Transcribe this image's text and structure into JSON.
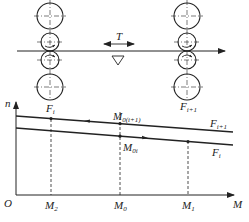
{
  "diagram": {
    "type": "rolling-mill-tension-diagram",
    "colors": {
      "ink": "#222222",
      "background": "#ffffff"
    },
    "stands": [
      {
        "id": "left",
        "label_base": "F",
        "label_sub": "i"
      },
      {
        "id": "right",
        "label_base": "F",
        "label_sub": "i+1"
      }
    ],
    "tension_label": "T",
    "level_marker": "triangle",
    "graph": {
      "y_axis_label": "n",
      "x_axis_label": "M",
      "origin_label": "O",
      "x_ticks": [
        {
          "base": "M",
          "sub": "2"
        },
        {
          "base": "M",
          "sub": "0"
        },
        {
          "base": "M",
          "sub": "1"
        }
      ],
      "point_labels": {
        "upper_left": {
          "base": "F",
          "sub": "i"
        },
        "top_mid": {
          "base": "M",
          "sub": "0(i+1)"
        },
        "lower_mid": {
          "base": "M",
          "sub": "0i"
        },
        "right_stand": {
          "base": "F",
          "sub": "i+1"
        }
      },
      "lines": [
        {
          "name": "upper",
          "label_base": "F",
          "label_sub": "i+1"
        },
        {
          "name": "lower",
          "label_base": "F",
          "label_sub": "i"
        }
      ]
    }
  }
}
